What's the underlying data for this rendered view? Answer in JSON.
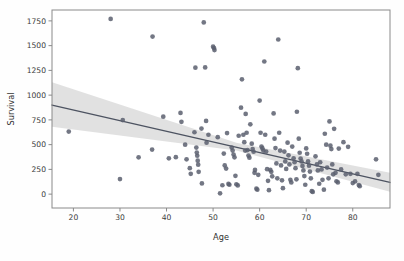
{
  "figure": {
    "background_color": "#fefefe",
    "plot_background_color": "#ffffff",
    "spine_color": "#8a8a8a"
  },
  "chart_data": {
    "type": "scatter",
    "title": "",
    "xlabel": "Age",
    "ylabel": "Survival",
    "xlim": [
      15.4,
      88.0
    ],
    "ylim": [
      -140,
      1860
    ],
    "xticks": [
      20,
      30,
      40,
      50,
      60,
      70,
      80
    ],
    "xticklabels": [
      "20",
      "30",
      "40",
      "50",
      "60",
      "70",
      "80"
    ],
    "yticks": [
      0,
      250,
      500,
      750,
      1000,
      1250,
      1500,
      1750
    ],
    "yticklabels": [
      "0",
      "250",
      "500",
      "750",
      "1000",
      "1250",
      "1500",
      "1750"
    ],
    "grid": false,
    "legend": null,
    "marker_color": "#5a5f6e",
    "marker_size": 18,
    "marker_opacity": 0.85,
    "regression": {
      "type": "linear",
      "line_color": "#4d5361",
      "band_color": "#c9c9c9",
      "band_opacity": 0.55,
      "x_start": 15.4,
      "y_start": 900,
      "x_end": 88.0,
      "y_end": 118,
      "ci_lower_start": 680,
      "ci_upper_start": 1130,
      "ci_lower_end": 25,
      "ci_upper_end": 215,
      "ci_lower_mid": 440,
      "ci_upper_mid": 520,
      "ci_mid_x": 55
    },
    "points": [
      [
        19.0,
        632
      ],
      [
        28.0,
        1770
      ],
      [
        30.6,
        748
      ],
      [
        30.0,
        152
      ],
      [
        34.0,
        372
      ],
      [
        37.0,
        1592
      ],
      [
        36.9,
        450
      ],
      [
        39.3,
        782
      ],
      [
        40.5,
        362
      ],
      [
        42.0,
        373
      ],
      [
        43.0,
        820
      ],
      [
        43.2,
        730
      ],
      [
        44.0,
        500
      ],
      [
        44.3,
        352
      ],
      [
        45.0,
        262
      ],
      [
        45.2,
        205
      ],
      [
        46.0,
        625
      ],
      [
        46.2,
        1277
      ],
      [
        46.4,
        470
      ],
      [
        46.5,
        420
      ],
      [
        46.6,
        388
      ],
      [
        46.7,
        338
      ],
      [
        46.8,
        298
      ],
      [
        46.9,
        225
      ],
      [
        47.5,
        662
      ],
      [
        47.6,
        108
      ],
      [
        48.0,
        1735
      ],
      [
        48.3,
        1280
      ],
      [
        48.5,
        740
      ],
      [
        48.6,
        520
      ],
      [
        49.0,
        600
      ],
      [
        50.0,
        1490
      ],
      [
        50.2,
        1475
      ],
      [
        50.3,
        1455
      ],
      [
        51.0,
        575
      ],
      [
        51.5,
        8
      ],
      [
        52.0,
        90
      ],
      [
        52.3,
        410
      ],
      [
        52.5,
        290
      ],
      [
        52.8,
        258
      ],
      [
        53.0,
        617
      ],
      [
        53.3,
        103
      ],
      [
        53.5,
        95
      ],
      [
        54.0,
        470
      ],
      [
        54.2,
        440
      ],
      [
        54.4,
        400
      ],
      [
        54.6,
        372
      ],
      [
        54.8,
        185
      ],
      [
        55.0,
        100
      ],
      [
        55.3,
        88
      ],
      [
        55.5,
        590
      ],
      [
        56.0,
        873
      ],
      [
        56.2,
        1160
      ],
      [
        56.5,
        600
      ],
      [
        56.7,
        525
      ],
      [
        56.9,
        440
      ],
      [
        57.0,
        810
      ],
      [
        57.2,
        620
      ],
      [
        57.4,
        445
      ],
      [
        57.6,
        390
      ],
      [
        57.8,
        368
      ],
      [
        58.0,
        705
      ],
      [
        58.3,
        510
      ],
      [
        58.5,
        455
      ],
      [
        58.7,
        428
      ],
      [
        58.9,
        215
      ],
      [
        59.0,
        245
      ],
      [
        59.3,
        55
      ],
      [
        59.5,
        45
      ],
      [
        59.7,
        195
      ],
      [
        60.0,
        945
      ],
      [
        60.2,
        620
      ],
      [
        60.4,
        480
      ],
      [
        60.6,
        462
      ],
      [
        60.8,
        440
      ],
      [
        61.0,
        1340
      ],
      [
        61.2,
        600
      ],
      [
        61.4,
        430
      ],
      [
        61.6,
        252
      ],
      [
        61.8,
        135
      ],
      [
        62.0,
        40
      ],
      [
        62.3,
        245
      ],
      [
        62.5,
        225
      ],
      [
        62.7,
        180
      ],
      [
        63.0,
        815
      ],
      [
        63.2,
        560
      ],
      [
        63.4,
        465
      ],
      [
        63.6,
        310
      ],
      [
        63.8,
        160
      ],
      [
        64.0,
        1562
      ],
      [
        64.2,
        620
      ],
      [
        64.4,
        440
      ],
      [
        64.6,
        290
      ],
      [
        64.8,
        140
      ],
      [
        65.0,
        60
      ],
      [
        65.3,
        430
      ],
      [
        65.5,
        330
      ],
      [
        65.7,
        255
      ],
      [
        66.0,
        520
      ],
      [
        66.2,
        392
      ],
      [
        66.4,
        300
      ],
      [
        66.6,
        145
      ],
      [
        66.8,
        118
      ],
      [
        67.0,
        480
      ],
      [
        67.3,
        362
      ],
      [
        67.5,
        322
      ],
      [
        67.7,
        262
      ],
      [
        67.9,
        150
      ],
      [
        68.0,
        832
      ],
      [
        68.2,
        1272
      ],
      [
        68.4,
        560
      ],
      [
        68.6,
        418
      ],
      [
        68.8,
        360
      ],
      [
        69.0,
        330
      ],
      [
        69.2,
        285
      ],
      [
        69.4,
        240
      ],
      [
        69.6,
        182
      ],
      [
        69.8,
        95
      ],
      [
        70.0,
        462
      ],
      [
        70.2,
        408
      ],
      [
        70.4,
        330
      ],
      [
        70.6,
        288
      ],
      [
        70.8,
        228
      ],
      [
        71.0,
        160
      ],
      [
        71.2,
        30
      ],
      [
        71.4,
        22
      ],
      [
        72.0,
        382
      ],
      [
        72.3,
        300
      ],
      [
        72.5,
        240
      ],
      [
        72.8,
        105
      ],
      [
        73.0,
        322
      ],
      [
        73.3,
        250
      ],
      [
        73.5,
        145
      ],
      [
        73.8,
        45
      ],
      [
        74.0,
        610
      ],
      [
        74.3,
        500
      ],
      [
        74.5,
        268
      ],
      [
        74.8,
        160
      ],
      [
        75.0,
        735
      ],
      [
        75.2,
        490
      ],
      [
        75.4,
        455
      ],
      [
        75.6,
        300
      ],
      [
        75.8,
        200
      ],
      [
        76.0,
        660
      ],
      [
        76.3,
        215
      ],
      [
        76.5,
        130
      ],
      [
        76.8,
        118
      ],
      [
        77.0,
        460
      ],
      [
        77.5,
        250
      ],
      [
        78.0,
        525
      ],
      [
        78.5,
        200
      ],
      [
        79.0,
        478
      ],
      [
        79.5,
        205
      ],
      [
        80.0,
        112
      ],
      [
        80.5,
        128
      ],
      [
        81.0,
        205
      ],
      [
        81.3,
        92
      ],
      [
        81.5,
        80
      ],
      [
        85.0,
        352
      ],
      [
        85.5,
        195
      ]
    ]
  }
}
